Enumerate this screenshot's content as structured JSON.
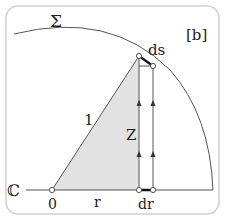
{
  "diagram": {
    "panel_label": "[b]",
    "surface_label": "Σ",
    "plane_label": "ℂ",
    "origin_label": "0",
    "radius_label": "r",
    "dr_label": "dr",
    "ds_label": "ds",
    "height_label": "Z",
    "hypotenuse_label": "1",
    "colors": {
      "frame": "#c8c8c8",
      "line": "#555555",
      "shade": "#e3e3e3",
      "accent": "#111111"
    }
  }
}
